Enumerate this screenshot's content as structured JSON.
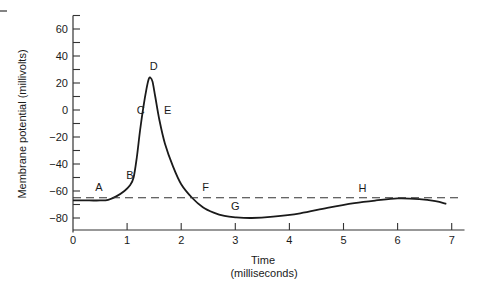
{
  "chart_data": {
    "type": "line",
    "title": "",
    "xlabel_line1": "Time",
    "xlabel_line2": "(milliseconds)",
    "ylabel": "Membrane potential (millivolts)",
    "xlim": [
      0,
      7.2
    ],
    "ylim": [
      -90,
      70
    ],
    "grid": false,
    "legend": null,
    "x_ticks": [
      0,
      1,
      2,
      3,
      4,
      5,
      6,
      7
    ],
    "x_tick_labels": [
      "0",
      "1",
      "2",
      "3",
      "4",
      "5",
      "6",
      "7"
    ],
    "y_ticks_major": [
      60,
      40,
      20,
      0,
      -20,
      -40,
      -60,
      -80
    ],
    "y_tick_labels": [
      "60",
      "40",
      "20",
      "0",
      "−20",
      "−40",
      "−60",
      "−80"
    ],
    "y_ticks_minor": [
      70,
      50,
      30,
      10,
      -10,
      -30,
      -50,
      -70
    ],
    "series": [
      {
        "name": "Action potential",
        "style": "solid",
        "x": [
          0,
          0.3,
          0.5,
          0.65,
          0.8,
          0.95,
          1.05,
          1.12,
          1.18,
          1.24,
          1.3,
          1.36,
          1.4,
          1.43,
          1.47,
          1.52,
          1.6,
          1.7,
          1.85,
          2.0,
          2.2,
          2.4,
          2.6,
          2.8,
          3.0,
          3.3,
          3.7,
          4.2,
          4.7,
          5.2,
          5.6,
          6.0,
          6.4,
          6.7,
          6.9
        ],
        "values": [
          -67,
          -67,
          -67,
          -66.5,
          -64,
          -60,
          -56,
          -50,
          -35,
          -15,
          2,
          16,
          23,
          24,
          21,
          10,
          -8,
          -25,
          -42,
          -55,
          -65,
          -72,
          -76,
          -78.5,
          -79.5,
          -80,
          -79,
          -76.5,
          -72.5,
          -69,
          -67,
          -65.5,
          -66,
          -67.5,
          -69.5
        ]
      },
      {
        "name": "Threshold / resting reference",
        "style": "dashed",
        "x": [
          0,
          7.2
        ],
        "values": [
          -65,
          -65
        ]
      }
    ],
    "annotations": [
      {
        "label": "A",
        "x": 0.48,
        "y": -60
      },
      {
        "label": "B",
        "x": 1.05,
        "y": -51
      },
      {
        "label": "C",
        "x": 1.25,
        "y": -3
      },
      {
        "label": "D",
        "x": 1.49,
        "y": 30
      },
      {
        "label": "E",
        "x": 1.75,
        "y": -3
      },
      {
        "label": "F",
        "x": 2.45,
        "y": -60
      },
      {
        "label": "G",
        "x": 3.0,
        "y": -74
      },
      {
        "label": "H",
        "x": 5.35,
        "y": -61
      }
    ]
  }
}
